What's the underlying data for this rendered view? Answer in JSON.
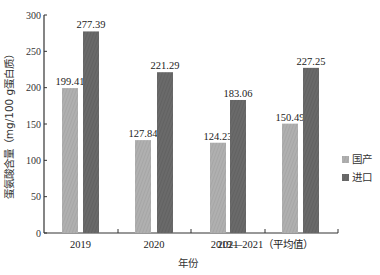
{
  "chart_data": {
    "type": "bar",
    "title": "",
    "xlabel": "年份",
    "ylabel": "蛋氨酸含量（mg/100 g蛋白质）",
    "ylim": [
      0,
      300
    ],
    "yticks": [
      0,
      50,
      100,
      150,
      200,
      250,
      300
    ],
    "categories": [
      "2019",
      "2020",
      "2021",
      "2019—2021（平均值）"
    ],
    "series": [
      {
        "name": "国产",
        "color": "#a8a8a8",
        "pattern": "light-hatch",
        "values": [
          199.41,
          127.84,
          124.23,
          150.49
        ]
      },
      {
        "name": "进口",
        "color": "#666666",
        "pattern": "dark-hatch",
        "values": [
          277.39,
          221.29,
          183.06,
          227.25
        ]
      }
    ],
    "value_labels": [
      [
        "199.41",
        "127.84",
        "124.23",
        "150.49"
      ],
      [
        "277.39",
        "221.29",
        "183.06",
        "227.25"
      ]
    ],
    "grid": false,
    "legend_position": "right"
  },
  "axes": {
    "x_title": "年份",
    "y_title": "蛋氨酸含量（mg/100 g蛋白质）",
    "y_tick_labels": [
      "0",
      "50",
      "100",
      "150",
      "200",
      "250",
      "300"
    ]
  },
  "legend": {
    "items": [
      {
        "label": "国产",
        "color": "#a8a8a8"
      },
      {
        "label": "进口",
        "color": "#666666"
      }
    ]
  }
}
